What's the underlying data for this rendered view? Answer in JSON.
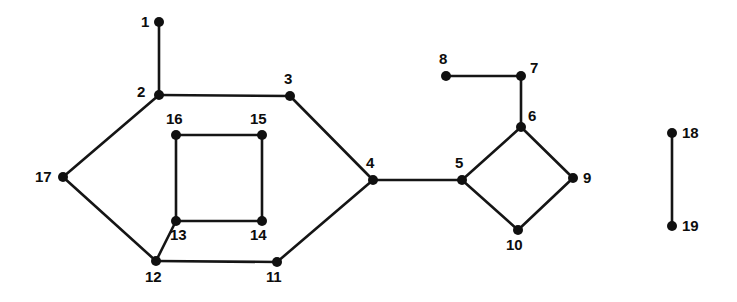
{
  "diagram": {
    "type": "undirected-graph",
    "title": "",
    "background_color": "#ffffff",
    "node_color": "#101010",
    "edge_color": "#151515",
    "node_radius": 5,
    "edge_width": 2.6,
    "width": 737,
    "height": 302,
    "nodes": [
      {
        "id": "1",
        "label": "1",
        "x": 159,
        "y": 22,
        "label_x": 141,
        "label_y": 14,
        "label_pos": "left"
      },
      {
        "id": "2",
        "label": "2",
        "x": 159,
        "y": 95,
        "label_x": 137,
        "label_y": 84,
        "label_pos": "upper-left"
      },
      {
        "id": "3",
        "label": "3",
        "x": 290,
        "y": 96,
        "label_x": 284,
        "label_y": 71,
        "label_pos": "above"
      },
      {
        "id": "4",
        "label": "4",
        "x": 373,
        "y": 180,
        "label_x": 366,
        "label_y": 155,
        "label_pos": "above"
      },
      {
        "id": "5",
        "label": "5",
        "x": 462,
        "y": 180,
        "label_x": 455,
        "label_y": 155,
        "label_pos": "above"
      },
      {
        "id": "6",
        "label": "6",
        "x": 521,
        "y": 127,
        "label_x": 528,
        "label_y": 108,
        "label_pos": "upper-right"
      },
      {
        "id": "7",
        "label": "7",
        "x": 521,
        "y": 76,
        "label_x": 530,
        "label_y": 60,
        "label_pos": "upper-right"
      },
      {
        "id": "8",
        "label": "8",
        "x": 446,
        "y": 76,
        "label_x": 439,
        "label_y": 51,
        "label_pos": "above"
      },
      {
        "id": "9",
        "label": "9",
        "x": 573,
        "y": 178,
        "label_x": 583,
        "label_y": 170,
        "label_pos": "right"
      },
      {
        "id": "10",
        "label": "10",
        "x": 518,
        "y": 230,
        "label_x": 506,
        "label_y": 237,
        "label_pos": "below"
      },
      {
        "id": "11",
        "label": "11",
        "x": 277,
        "y": 262,
        "label_x": 266,
        "label_y": 269,
        "label_pos": "below"
      },
      {
        "id": "12",
        "label": "12",
        "x": 156,
        "y": 261,
        "label_x": 145,
        "label_y": 269,
        "label_pos": "below"
      },
      {
        "id": "13",
        "label": "13",
        "x": 176,
        "y": 221,
        "label_x": 170,
        "label_y": 227,
        "label_pos": "below-right"
      },
      {
        "id": "14",
        "label": "14",
        "x": 262,
        "y": 221,
        "label_x": 250,
        "label_y": 227,
        "label_pos": "below"
      },
      {
        "id": "15",
        "label": "15",
        "x": 262,
        "y": 135,
        "label_x": 250,
        "label_y": 111,
        "label_pos": "above"
      },
      {
        "id": "16",
        "label": "16",
        "x": 176,
        "y": 135,
        "label_x": 166,
        "label_y": 111,
        "label_pos": "above"
      },
      {
        "id": "17",
        "label": "17",
        "x": 63,
        "y": 177,
        "label_x": 35,
        "label_y": 169,
        "label_pos": "left"
      },
      {
        "id": "18",
        "label": "18",
        "x": 672,
        "y": 133,
        "label_x": 682,
        "label_y": 125,
        "label_pos": "right"
      },
      {
        "id": "19",
        "label": "19",
        "x": 672,
        "y": 226,
        "label_x": 682,
        "label_y": 218,
        "label_pos": "right"
      }
    ],
    "edges": [
      {
        "from": "1",
        "to": "2"
      },
      {
        "from": "2",
        "to": "3"
      },
      {
        "from": "2",
        "to": "17"
      },
      {
        "from": "3",
        "to": "4"
      },
      {
        "from": "4",
        "to": "5"
      },
      {
        "from": "4",
        "to": "11"
      },
      {
        "from": "5",
        "to": "6"
      },
      {
        "from": "5",
        "to": "10"
      },
      {
        "from": "6",
        "to": "7"
      },
      {
        "from": "6",
        "to": "9"
      },
      {
        "from": "7",
        "to": "8"
      },
      {
        "from": "9",
        "to": "10"
      },
      {
        "from": "11",
        "to": "12"
      },
      {
        "from": "12",
        "to": "13"
      },
      {
        "from": "12",
        "to": "17"
      },
      {
        "from": "13",
        "to": "14"
      },
      {
        "from": "13",
        "to": "16"
      },
      {
        "from": "14",
        "to": "15"
      },
      {
        "from": "15",
        "to": "16"
      },
      {
        "from": "18",
        "to": "19"
      }
    ]
  }
}
